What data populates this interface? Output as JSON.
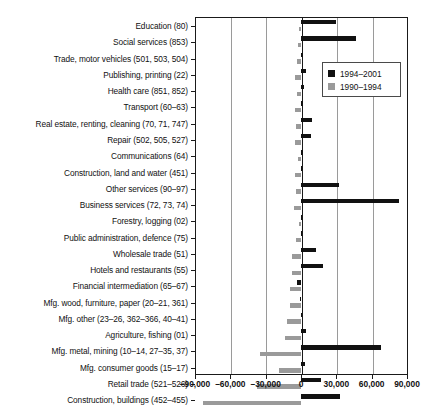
{
  "legend": {
    "items": [
      {
        "label": "1994–2001",
        "color": "#111111",
        "swatch": "square-black"
      },
      {
        "label": "1990–1994",
        "color": "#9a9a9a",
        "swatch": "square-gray"
      }
    ]
  },
  "caption": "",
  "chart_data": {
    "type": "bar",
    "orientation": "horizontal",
    "title": "",
    "xlabel": "",
    "ylabel": "",
    "xlim": [
      -90000,
      90000
    ],
    "xticks": [
      -90000,
      -60000,
      -30000,
      0,
      30000,
      60000,
      90000
    ],
    "xticklabels": [
      "–90,000",
      "–60,000",
      "–30,000",
      "0",
      "30,000",
      "60,000",
      "90,000"
    ],
    "grid": true,
    "legend_position": "upper right",
    "categories": [
      "Education (80)",
      "Social services (853)",
      "Trade, motor vehicles (501, 503, 504)",
      "Publishing, printing (22)",
      "Health care (851, 852)",
      "Transport (60–63)",
      "Real estate, renting, cleaning (70, 71, 747)",
      "Repair (502, 505, 527)",
      "Communications (64)",
      "Construction, land and water (451)",
      "Other services (90–97)",
      "Business services (72, 73, 74)",
      "Forestry, logging (02)",
      "Public administration, defence (75)",
      "Wholesale trade (51)",
      "Hotels and restaurants (55)",
      "Financial intermediation (65–67)",
      "Mfg. wood, furniture, paper (20–21, 361)",
      "Mfg. other (23–26, 362–366, 40–41)",
      "Agriculture, fishing (01)",
      "Mfg. metal, mining (10–14, 27–35, 37)",
      "Mfg. consumer goods (15–17)",
      "Retail trade (521–526)",
      "Construction, buildings (452–455)"
    ],
    "series": [
      {
        "name": "1994–2001",
        "color": "#111111",
        "values": [
          30000,
          47000,
          2000,
          4000,
          2500,
          1500,
          9000,
          8500,
          2000,
          1000,
          32000,
          83000,
          500,
          1000,
          13000,
          19000,
          -3500,
          -1000,
          500,
          4000,
          68000,
          3000,
          17000,
          33000
        ]
      },
      {
        "name": "1990–1994",
        "color": "#9a9a9a",
        "values": [
          -1500,
          -2500,
          -3500,
          -5000,
          -3000,
          -5500,
          -4500,
          -5500,
          -2500,
          -5000,
          -4500,
          -6000,
          -2000,
          -4000,
          -7500,
          -8000,
          -9000,
          -9500,
          -12000,
          -14000,
          -35000,
          -19000,
          -37000,
          -83000
        ]
      }
    ]
  }
}
